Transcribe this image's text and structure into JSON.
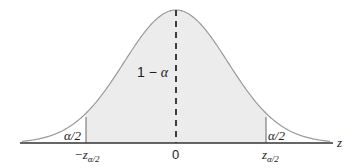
{
  "diagram": {
    "colors": {
      "shaded": "#ececec",
      "curve": "#9a9a9a",
      "axis": "#333333",
      "text": "#222222"
    },
    "labels": {
      "center_area": "1 − α",
      "left_tail": "α/2",
      "right_tail": "α/2",
      "left_critical": "−z",
      "left_critical_sub": "α/2",
      "right_critical": "z",
      "right_critical_sub": "α/2",
      "origin": "0",
      "axis_var": "z"
    }
  }
}
